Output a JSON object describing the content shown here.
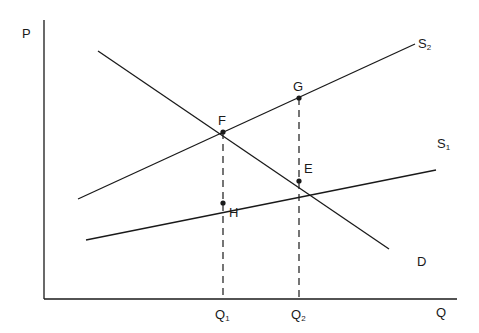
{
  "diagram": {
    "colors": {
      "line": "#1a1a1a",
      "background": "#ffffff"
    },
    "axes": {
      "y_label": "P",
      "x_label": "Q",
      "x_ticks": [
        {
          "base": "Q",
          "sub": "1",
          "x": 223
        },
        {
          "base": "Q",
          "sub": "2",
          "x": 299
        }
      ]
    },
    "curves": [
      {
        "id": "D",
        "label": "D",
        "label_sub": "",
        "from": [
          98,
          51
        ],
        "to": [
          389,
          249
        ]
      },
      {
        "id": "S2",
        "label": "S",
        "label_sub": "2",
        "from": [
          78,
          199
        ],
        "to": [
          415,
          44
        ]
      },
      {
        "id": "S1",
        "label": "S",
        "label_sub": "1",
        "from": [
          86,
          240
        ],
        "to": [
          436,
          170
        ]
      }
    ],
    "points": [
      {
        "label": "F",
        "x": 223,
        "y": 132
      },
      {
        "label": "E",
        "x": 299,
        "y": 181
      },
      {
        "label": "G",
        "x": 299,
        "y": 98
      },
      {
        "label": "H",
        "x": 223,
        "y": 203
      }
    ],
    "dashed_guides": [
      {
        "from_point": "F",
        "x": 223,
        "y1": 132,
        "y2": 299
      },
      {
        "from_point": "G",
        "x": 299,
        "y1": 98,
        "y2": 299
      }
    ]
  }
}
